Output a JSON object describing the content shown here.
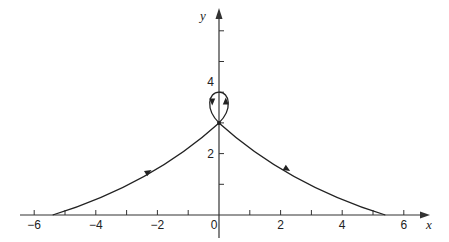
{
  "chart_data": {
    "type": "line",
    "title": "",
    "xlabel": "x",
    "ylabel": "y",
    "xlim": [
      -6.3,
      6.8
    ],
    "ylim": [
      -0.7,
      6.6
    ],
    "grid": false,
    "x_ticks": [
      -6,
      -5,
      -4,
      -3,
      -2,
      -1,
      1,
      2,
      3,
      4,
      5,
      6
    ],
    "x_tick_labels": [
      "-6",
      "-4",
      "-2",
      "0",
      "2",
      "4",
      "6"
    ],
    "x_tick_label_values": [
      -6,
      -4,
      -2,
      0,
      2,
      4,
      6
    ],
    "y_ticks": [
      1,
      2,
      3,
      4,
      5,
      6
    ],
    "y_tick_labels": [
      "2",
      "4"
    ],
    "y_tick_label_values": [
      2,
      4
    ],
    "series": [
      {
        "name": "trajectory",
        "description": "Curve rising from (-5.4,0) to a self-intersection at (0,3), looping up to (0,4) and back, then descending to (5.4,0)",
        "x": [
          -5.4,
          -4.5,
          -3.5,
          -2.5,
          -1.5,
          -0.7,
          0,
          -0.25,
          -0.22,
          0,
          0.22,
          0.25,
          0,
          0.7,
          1.5,
          2.5,
          3.5,
          4.5,
          5.4
        ],
        "y": [
          0,
          0.45,
          0.95,
          1.5,
          2.05,
          2.55,
          3.0,
          3.55,
          3.85,
          4.0,
          3.85,
          3.55,
          3.0,
          2.55,
          2.05,
          1.5,
          0.95,
          0.45,
          0
        ],
        "direction_arrows": [
          {
            "x": -2.3,
            "y": 1.4,
            "direction": "up-right"
          },
          {
            "x": -0.22,
            "y": 3.7,
            "direction": "down"
          },
          {
            "x": 0.22,
            "y": 3.7,
            "direction": "up"
          },
          {
            "x": 2.2,
            "y": 1.5,
            "direction": "down-right"
          }
        ]
      }
    ],
    "annotations": [
      {
        "text": "crossing point",
        "x": 0,
        "y": 3.0
      }
    ]
  },
  "axes": {
    "x_label": "x",
    "y_label": "y"
  }
}
